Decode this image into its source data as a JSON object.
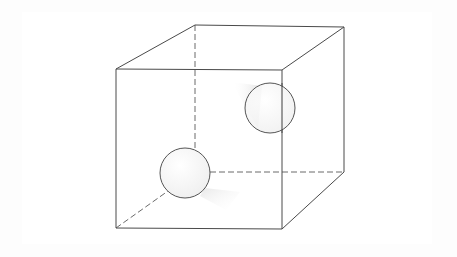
{
  "diagram": {
    "title": "",
    "colors": {
      "background": "#fdfdfd",
      "edge": "#4a4a4a",
      "hidden_edge": "#6a6a6a",
      "sphere_stroke": "#555555",
      "sphere_fill": "#f6f6f6",
      "shadow": "#e6e6e6"
    },
    "cube": {
      "front": {
        "tl": [
          116,
          69
        ],
        "tr": [
          282,
          70
        ],
        "br": [
          282,
          229
        ],
        "bl": [
          116,
          228
        ]
      },
      "back": {
        "tl": [
          195,
          25
        ],
        "tr": [
          344,
          27
        ],
        "br": [
          344,
          172
        ],
        "bl": [
          195,
          172
        ]
      },
      "hidden_edges": [
        "back-left-vertical",
        "back-bottom",
        "bottom-left-diagonal"
      ]
    },
    "spheres": [
      {
        "name": "sphere-left",
        "cx": 185,
        "cy": 173,
        "r": 25
      },
      {
        "name": "sphere-right",
        "cx": 270,
        "cy": 108,
        "r": 25
      }
    ]
  }
}
